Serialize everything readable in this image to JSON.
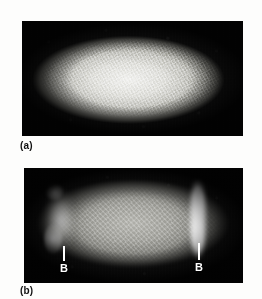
{
  "figure": {
    "background_color": "#fdfdfc",
    "panels": [
      {
        "id": "a",
        "caption": "(a)",
        "frame_color": "#0a0a0a",
        "subject": "drosophila-embryo-micrograph",
        "description": "bright speckled ellipse with uniform nuclear staining",
        "annotations": []
      },
      {
        "id": "b",
        "caption": "(b)",
        "frame_color": "#0a0a0a",
        "subject": "drosophila-embryo-micrograph",
        "description": "dim oval with two bright terminal bands",
        "annotations": [
          {
            "label": "B",
            "position": "left",
            "color": "#ffffff"
          },
          {
            "label": "B",
            "position": "right",
            "color": "#ffffff"
          }
        ]
      }
    ]
  }
}
